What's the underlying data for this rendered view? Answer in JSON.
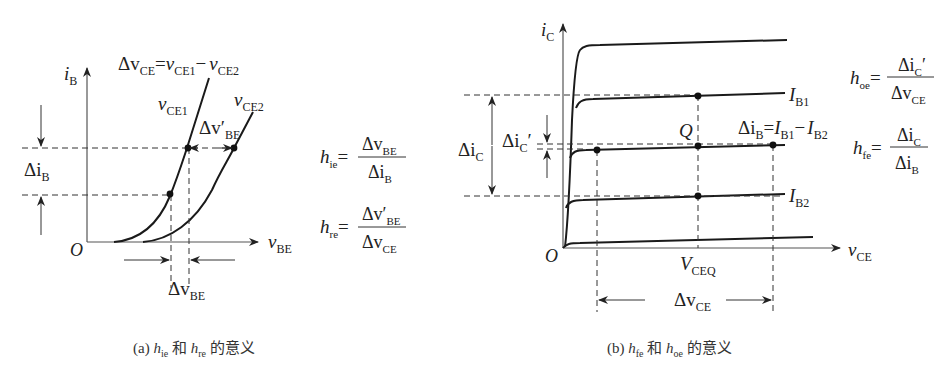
{
  "panel_a": {
    "y_axis_label": "i",
    "y_axis_sub": "B",
    "x_axis_label": "v",
    "x_axis_sub": "BE",
    "origin": "O",
    "delta_vce_eq": {
      "lhs": "Δv",
      "lhs_sub": "CE",
      "eq": "=",
      "a": "v",
      "a_sub": "CE1",
      "minus": "−",
      "b": "v",
      "b_sub": "CE2"
    },
    "curve1_label": {
      "v": "v",
      "sub": "CE1"
    },
    "curve2_label": {
      "v": "v",
      "sub": "CE2"
    },
    "delta_vbe_prime": {
      "d": "Δv′",
      "sub": "BE"
    },
    "delta_ib": {
      "d": "Δi",
      "sub": "B"
    },
    "delta_vbe": {
      "d": "Δv",
      "sub": "BE"
    },
    "formula_hie": {
      "h": "h",
      "h_sub": "ie",
      "eq": "=",
      "num": "Δv",
      "num_sub": "BE",
      "den": "Δi",
      "den_sub": "B"
    },
    "formula_hre": {
      "h": "h",
      "h_sub": "re",
      "eq": "=",
      "num": "Δv′",
      "num_sub": "BE",
      "den": "Δv",
      "den_sub": "CE"
    },
    "caption": {
      "prefix": "(a) ",
      "h1": "h",
      "h1_sub": "ie",
      "and": " 和 ",
      "h2": "h",
      "h2_sub": "re",
      "suffix": " 的意义"
    }
  },
  "panel_b": {
    "y_axis_label": "i",
    "y_axis_sub": "C",
    "x_axis_label": "v",
    "x_axis_sub": "CE",
    "origin": "O",
    "ib1_label": {
      "I": "I",
      "sub": "B1"
    },
    "ib2_label": {
      "I": "I",
      "sub": "B2"
    },
    "q_label": "Q",
    "vceq_label": {
      "V": "V",
      "sub": "CEQ"
    },
    "delta_ib_eq": {
      "d": "Δi",
      "d_sub": "B",
      "eq": "=",
      "a": "I",
      "a_sub": "B1",
      "minus": "−",
      "b": "I",
      "b_sub": "B2"
    },
    "delta_ic": {
      "d": "Δi",
      "sub": "C"
    },
    "delta_ic_prime": {
      "d": "Δi",
      "sub": "C",
      "prime": "′"
    },
    "delta_vce": {
      "d": "Δv",
      "sub": "CE"
    },
    "formula_hoe": {
      "h": "h",
      "h_sub": "oe",
      "eq": "=",
      "num": "Δi",
      "num_sub": "C",
      "num_prime": "′",
      "den": "Δv",
      "den_sub": "CE"
    },
    "formula_hfe": {
      "h": "h",
      "h_sub": "fe",
      "eq": "=",
      "num": "Δi",
      "num_sub": "C",
      "den": "Δi",
      "den_sub": "B"
    },
    "caption": {
      "prefix": "(b) ",
      "h1": "h",
      "h1_sub": "fe",
      "and": " 和 ",
      "h2": "h",
      "h2_sub": "oe",
      "suffix": " 的意义"
    }
  }
}
